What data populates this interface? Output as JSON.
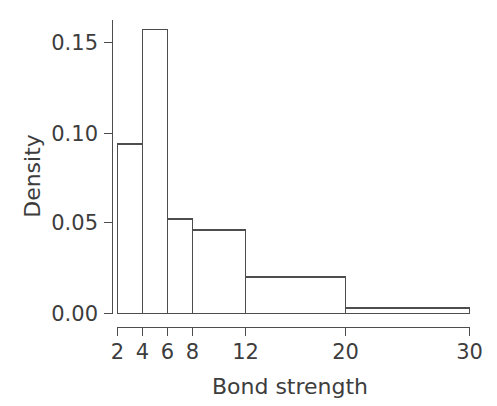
{
  "chart_data": {
    "type": "bar",
    "subtype": "histogram",
    "title": "",
    "xlabel": "Bond strength",
    "ylabel": "Density",
    "xlim": [
      2,
      30
    ],
    "ylim": [
      0.0,
      0.1625
    ],
    "grid": false,
    "legend": "none",
    "xticks": [
      2,
      4,
      6,
      8,
      12,
      20,
      30
    ],
    "xticklabels": [
      "2",
      "4",
      "6",
      "8",
      "12",
      "20",
      "30"
    ],
    "yticks": [
      0.0,
      0.05,
      0.1,
      0.15
    ],
    "yticklabels": [
      "0.00",
      "0.05",
      "0.10",
      "0.15"
    ],
    "bin_edges": [
      2,
      4,
      6,
      8,
      12,
      20,
      30
    ],
    "categories": [
      "2-4",
      "4-6",
      "6-8",
      "8-12",
      "12-20",
      "20-30"
    ],
    "values": [
      0.093,
      0.156,
      0.052,
      0.046,
      0.02,
      0.003
    ],
    "bars": [
      {
        "label": "2-4",
        "x0": 2,
        "x1": 4,
        "density": 0.093
      },
      {
        "label": "4-6",
        "x0": 4,
        "x1": 6,
        "density": 0.156
      },
      {
        "label": "6-8",
        "x0": 6,
        "x1": 8,
        "density": 0.052
      },
      {
        "label": "8-12",
        "x0": 8,
        "x1": 12,
        "density": 0.046
      },
      {
        "label": "12-20",
        "x0": 12,
        "x1": 20,
        "density": 0.02
      },
      {
        "label": "20-30",
        "x0": 20,
        "x1": 30,
        "density": 0.003
      }
    ],
    "colors": {
      "bar_fill": "#ffffff",
      "bar_stroke": "#4d4d4d",
      "axis": "#4d4d4d",
      "text": "#3d3d3d",
      "background": "#ffffff"
    }
  },
  "axes": {
    "x_title": "Bond strength",
    "y_title": "Density",
    "x_tick_labels": [
      "2",
      "4",
      "6",
      "8",
      "12",
      "20",
      "30"
    ],
    "y_tick_labels": [
      "0.00",
      "0.05",
      "0.10",
      "0.15"
    ]
  }
}
